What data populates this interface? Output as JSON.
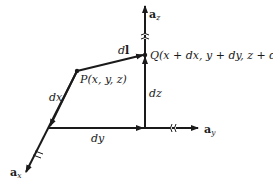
{
  "diagram": {
    "type": "vector-differential-length",
    "colors": {
      "line": "#1a1a1a",
      "background": "#ffffff"
    },
    "points": {
      "P": {
        "label": "P(x, y, z)"
      },
      "Q": {
        "label": "Q(x + dx, y + dy, z + dz)"
      }
    },
    "axes": {
      "x": {
        "base": "a",
        "sub": "x"
      },
      "y": {
        "base": "a",
        "sub": "y"
      },
      "z": {
        "base": "a",
        "sub": "z"
      }
    },
    "segments": {
      "dx": "dx",
      "dy": "dy",
      "dz": "dz",
      "dl_prefix": "d",
      "dl_bold": "l"
    }
  }
}
